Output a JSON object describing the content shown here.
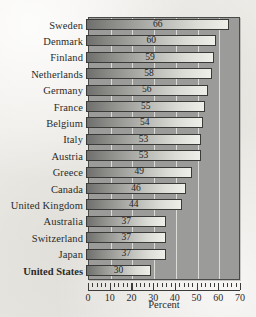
{
  "chart_data": {
    "type": "bar",
    "orientation": "horizontal",
    "title": "",
    "xlabel": "Percent",
    "ylabel": "",
    "xlim": [
      0,
      70
    ],
    "xticks": [
      0,
      10,
      20,
      30,
      40,
      50,
      60,
      70
    ],
    "grid": true,
    "legend": false,
    "categories": [
      "Sweden",
      "Denmark",
      "Finland",
      "Netherlands",
      "Germany",
      "France",
      "Belgium",
      "Italy",
      "Austria",
      "Greece",
      "Canada",
      "United Kingdom",
      "Australia",
      "Switzerland",
      "Japan",
      "United States"
    ],
    "values": [
      66,
      60,
      59,
      58,
      56,
      55,
      54,
      53,
      53,
      49,
      46,
      44,
      37,
      37,
      37,
      30
    ],
    "emphasized_categories": [
      "United States"
    ],
    "colors": {
      "plot_background": "#9b9b99",
      "page_background": "#eceae5",
      "bar_start": "#6f6f6d",
      "bar_end": "#efefea",
      "bar_border": "#3a3a38",
      "gridline": "#e8e8e4",
      "axis": "#3b3b39",
      "text": "#2b2b29"
    }
  }
}
